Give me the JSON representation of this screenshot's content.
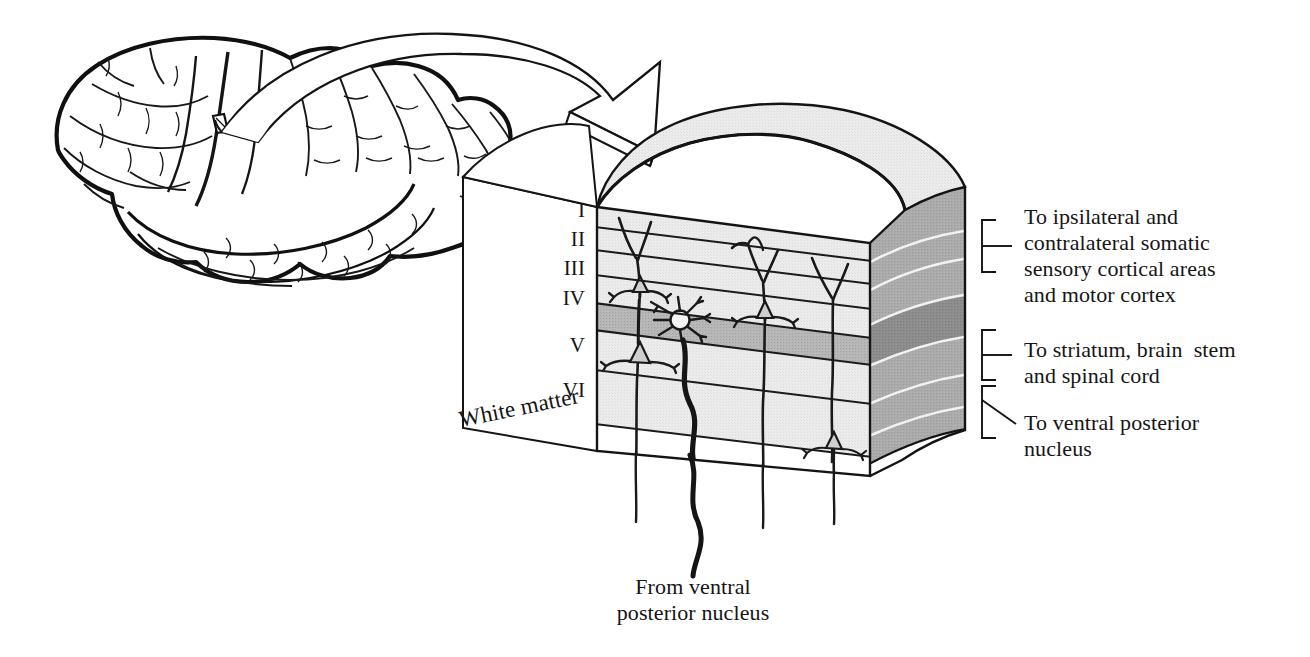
{
  "figure": {
    "colors": {
      "ink": "#151515",
      "front_face": "#ebebeb",
      "top_face": "#e8e8e8",
      "side_face": "#a8a8a8",
      "layer4_front": "#b4b4b4",
      "layer4_side": "#8a8a8a",
      "white_matter": "#ffffff",
      "outline": "#1a1a1a"
    }
  },
  "brain": {
    "name": "lateral view of human cerebral hemisphere",
    "marker": "cortical sample site"
  },
  "arrow": {
    "name": "magnification arrow",
    "from": "cortical sample site on brain",
    "to": "cortical block diagram"
  },
  "block": {
    "left_face_label": "White matter",
    "laminae": [
      {
        "numeral": "I",
        "name": "layer-1"
      },
      {
        "numeral": "II",
        "name": "layer-2"
      },
      {
        "numeral": "III",
        "name": "layer-3"
      },
      {
        "numeral": "IV",
        "name": "layer-4"
      },
      {
        "numeral": "V",
        "name": "layer-5"
      },
      {
        "numeral": "VI",
        "name": "layer-6"
      }
    ],
    "cells": [
      "pyramidal-neuron-layer-3",
      "pyramidal-neuron-layer-3-right",
      "stellate-neuron-layer-4",
      "pyramidal-neuron-layer-5",
      "pyramidal-neuron-layer-6"
    ]
  },
  "projections": [
    {
      "bracket": "bracket-upper",
      "lines": [
        "To ipsilateral and",
        "contralateral somatic",
        "sensory cortical areas",
        "and motor cortex"
      ],
      "text": "To ipsilateral and\ncontralateral somatic\nsensory cortical areas\nand motor cortex"
    },
    {
      "bracket": "bracket-middle",
      "lines": [
        "To striatum, brain  stem",
        "and spinal cord"
      ],
      "text": "To striatum, brain  stem\nand spinal cord"
    },
    {
      "bracket": "bracket-lower",
      "lines": [
        "To ventral posterior",
        "nucleus"
      ],
      "text": "To ventral posterior\nnucleus"
    }
  ],
  "afferent": {
    "lines": [
      "From ventral",
      "posterior nucleus"
    ],
    "text": "From ventral\nposterior nucleus"
  }
}
